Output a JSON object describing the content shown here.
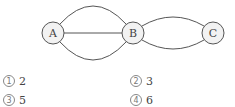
{
  "graph": {
    "nodes": [
      {
        "id": "A",
        "label": "A",
        "cx": 53,
        "cy": 33
      },
      {
        "id": "B",
        "label": "B",
        "cx": 133,
        "cy": 33
      },
      {
        "id": "C",
        "label": "C",
        "cx": 213,
        "cy": 33
      }
    ],
    "node_radius": 11,
    "edges": [
      {
        "from": "A",
        "to": "B",
        "shape": "arc-top"
      },
      {
        "from": "A",
        "to": "B",
        "shape": "straight"
      },
      {
        "from": "A",
        "to": "B",
        "shape": "arc-bottom"
      },
      {
        "from": "B",
        "to": "C",
        "shape": "arc-top"
      },
      {
        "from": "B",
        "to": "C",
        "shape": "arc-bottom"
      }
    ],
    "stroke_color": "#555555",
    "node_fill": "#f2f2f2"
  },
  "options": [
    {
      "marker": "1",
      "value": "2"
    },
    {
      "marker": "2",
      "value": "3"
    },
    {
      "marker": "3",
      "value": "5"
    },
    {
      "marker": "4",
      "value": "6"
    }
  ]
}
